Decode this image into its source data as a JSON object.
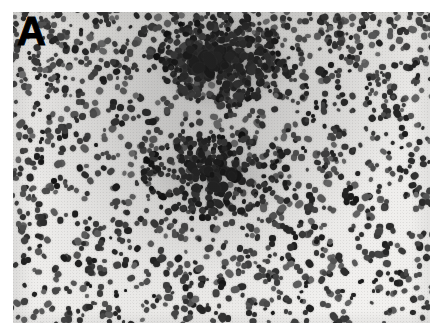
{
  "figure": {
    "type": "photomicrograph",
    "modality": "light-microscopy",
    "staining_appearance": "grayscale / monochrome histology print",
    "panel_label": "A",
    "caption_text": "",
    "margins": {
      "background_color": "#ffffff",
      "left_px": 13,
      "top_px": 12,
      "right_px": 12,
      "bottom_px": 6
    },
    "plate": {
      "x": 13,
      "y": 12,
      "width": 417,
      "height": 311,
      "background_color": "#f1f0ee",
      "cell_color": "#2b2b2b",
      "haze_color": "#5a5a5a"
    },
    "content_description": "Densely scattered small dark-stained nuclei distributed across a pale background, with two darker confluent cellular foci: one large dense cluster in the upper-centre and a second, more diffuse cluster near the centre of the field.",
    "features": [
      {
        "name": "upper-central dense focus",
        "center_x_pct": 50,
        "center_y_pct": 15,
        "relative_density": "high"
      },
      {
        "name": "central diffuse focus",
        "center_x_pct": 49,
        "center_y_pct": 52,
        "relative_density": "moderate"
      },
      {
        "name": "background scattered nuclei",
        "center_x_pct": 50,
        "center_y_pct": 50,
        "relative_density": "uniform-sparse"
      }
    ]
  }
}
